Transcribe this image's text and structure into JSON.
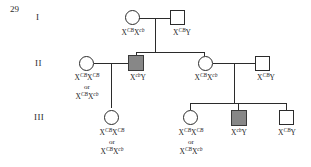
{
  "question_number": "29",
  "generations": [
    {
      "label": "I"
    },
    {
      "label": "II"
    },
    {
      "label": "III"
    }
  ],
  "individuals": [
    {
      "id": "I-1",
      "sex": "female",
      "affected": false,
      "genotype_lines": [
        "XCBXcb"
      ],
      "genotype_text": "X^CB X^cb"
    },
    {
      "id": "I-2",
      "sex": "male",
      "affected": false,
      "genotype_lines": [
        "XCBY"
      ],
      "genotype_text": "X^CB Y"
    },
    {
      "id": "II-1",
      "sex": "female",
      "affected": false,
      "genotype_lines": [
        "XCBXCB",
        "or",
        "XCBXcb"
      ],
      "genotype_text": "X^CB X^CB or X^CB X^cb"
    },
    {
      "id": "II-2",
      "sex": "male",
      "affected": true,
      "genotype_lines": [
        "XcbY"
      ],
      "genotype_text": "X^cb Y"
    },
    {
      "id": "II-3",
      "sex": "female",
      "affected": false,
      "genotype_lines": [
        "XCBXcb"
      ],
      "genotype_text": "X^CB X^cb"
    },
    {
      "id": "II-4",
      "sex": "male",
      "affected": false,
      "genotype_lines": [
        "XCBY"
      ],
      "genotype_text": "X^CB Y"
    },
    {
      "id": "III-1",
      "sex": "female",
      "affected": false,
      "genotype_lines": [
        "XCBXCB",
        "or",
        "XCBXcb"
      ],
      "genotype_text": "X^CB X^CB or X^CB X^cb"
    },
    {
      "id": "III-2",
      "sex": "female",
      "affected": false,
      "genotype_lines": [
        "XCBXCB",
        "or",
        "XCBXcb"
      ],
      "genotype_text": "X^CB X^CB or X^CB X^cb"
    },
    {
      "id": "III-3",
      "sex": "male",
      "affected": true,
      "genotype_lines": [
        "XcbY"
      ],
      "genotype_text": "X^cb Y"
    },
    {
      "id": "III-4",
      "sex": "male",
      "affected": false,
      "genotype_lines": [
        "XCBY"
      ],
      "genotype_text": "X^CB Y"
    }
  ],
  "allele_labels": {
    "normal": "CB",
    "mutant": "cb",
    "x_symbol": "X",
    "y_symbol": "Y",
    "or_word": "or"
  },
  "colors": {
    "affected_fill": "#878787",
    "unaffected_fill": "#ffffff",
    "stroke": "#2b2b2b",
    "text": "#1e1e1e",
    "background": "#ffffff"
  }
}
